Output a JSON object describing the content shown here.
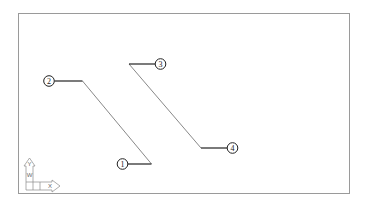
{
  "viewport": {
    "frame": {
      "x": 18,
      "y": 13,
      "width": 331,
      "height": 180,
      "color": "#9a9a9a"
    }
  },
  "callouts": [
    {
      "label": "1",
      "circle": {
        "cx": 122.5,
        "cy": 164
      },
      "leader_end": {
        "x": 151.5,
        "y": 164
      }
    },
    {
      "label": "2",
      "circle": {
        "cx": 49,
        "cy": 81
      },
      "leader_end": {
        "x": 82.5,
        "y": 81
      }
    },
    {
      "label": "3",
      "circle": {
        "cx": 160.5,
        "cy": 64
      },
      "leader_end": {
        "x": 129,
        "y": 64
      }
    },
    {
      "label": "4",
      "circle": {
        "cx": 232.5,
        "cy": 148
      },
      "leader_end": {
        "x": 201,
        "y": 148
      }
    }
  ],
  "diagonal_lines": [
    {
      "from": {
        "x": 82.5,
        "y": 81
      },
      "to": {
        "x": 151.5,
        "y": 164
      }
    },
    {
      "from": {
        "x": 129,
        "y": 64
      },
      "to": {
        "x": 201,
        "y": 148
      }
    }
  ],
  "ucs_icon": {
    "y_label": "Y",
    "x_label": "X",
    "w_label": "W"
  },
  "colors": {
    "line": "#555555",
    "leader": "#222222",
    "ucs": "#8a8a8a"
  }
}
